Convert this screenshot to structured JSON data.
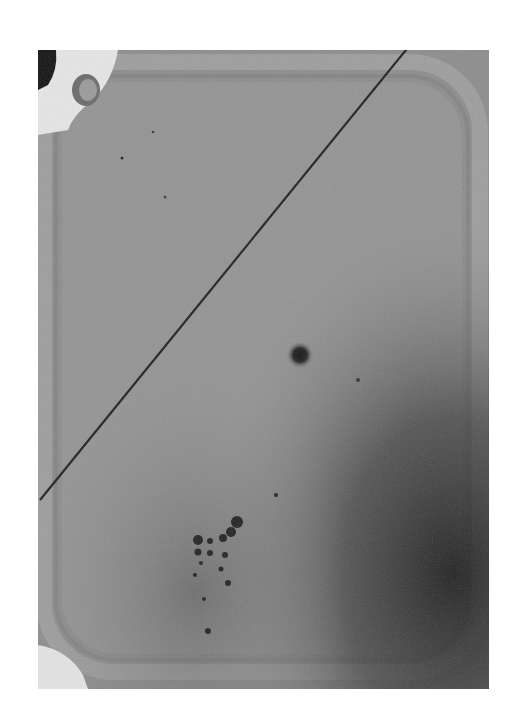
{
  "image": {
    "description": "Grayscale micrograph of a rounded-square sample well with a diagonal scratch line, a central dark spot, and a cluster of dark particles near the lower left",
    "colors": {
      "background": "#8a8a8a",
      "rim": "#a2a2a2",
      "dark_region": "#2a2a2a",
      "line": "#1e1e1e",
      "white_debris": "#e8e8e8"
    }
  }
}
